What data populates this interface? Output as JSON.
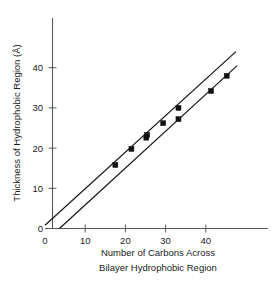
{
  "chart_data": {
    "type": "line",
    "title": "",
    "xlabel": "Number of Carbons Across Bilayer Hydrophobic Region",
    "xlabel_line1": "Number of Carbons Across",
    "xlabel_line2": "Bilayer Hydrophobic Region",
    "ylabel": "Thickness of Hydrophobic Region (Å)",
    "xlim": [
      0,
      48
    ],
    "ylim": [
      0,
      46
    ],
    "xticks": [
      0,
      10,
      20,
      30,
      40
    ],
    "xticklabels": [
      "0",
      "10",
      "20",
      "30",
      "40"
    ],
    "yticks": [
      0,
      10,
      20,
      30,
      40
    ],
    "yticklabels": [
      "0",
      "10",
      "20",
      "30",
      "40"
    ],
    "grid": false,
    "legend": "none",
    "series": [
      {
        "name": "upper-line",
        "line_endpoints": [
          [
            0,
            0.8
          ],
          [
            47.5,
            44.0
          ]
        ],
        "x": [
          17.5,
          21.5,
          25.4,
          29.4,
          33.2
        ],
        "y": [
          15.8,
          19.8,
          23.3,
          26.2,
          30.0
        ],
        "marker": "square"
      },
      {
        "name": "lower-line",
        "line_endpoints": [
          [
            3.6,
            0.0
          ],
          [
            47.8,
            40.5
          ]
        ],
        "x": [
          25.2,
          33.2,
          41.3,
          45.2
        ],
        "y": [
          22.6,
          27.2,
          34.2,
          38.0
        ],
        "marker": "square"
      }
    ]
  },
  "figure": {
    "axis_color": "#555c5c",
    "data_color": "#111111",
    "background": "#ffffff"
  }
}
